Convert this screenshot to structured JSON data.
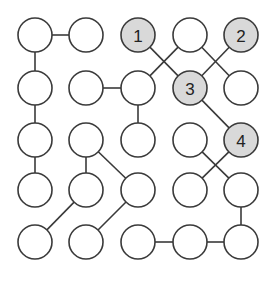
{
  "diagram": {
    "type": "numbered-circle-path-puzzle",
    "grid": {
      "rows": 5,
      "cols": 5
    },
    "colors": {
      "stroke": "#3a3a3a",
      "empty_fill": "#ffffff",
      "numbered_fill": "#d9d9d9",
      "label": "#222222"
    },
    "col_x": [
      35,
      86,
      138,
      190,
      241
    ],
    "row_y": [
      35,
      88,
      140,
      190,
      242
    ],
    "radius": 17,
    "nodes": [
      {
        "r": 0,
        "c": 0,
        "label": ""
      },
      {
        "r": 0,
        "c": 1,
        "label": ""
      },
      {
        "r": 0,
        "c": 2,
        "label": "1"
      },
      {
        "r": 0,
        "c": 3,
        "label": ""
      },
      {
        "r": 0,
        "c": 4,
        "label": "2"
      },
      {
        "r": 1,
        "c": 0,
        "label": ""
      },
      {
        "r": 1,
        "c": 1,
        "label": ""
      },
      {
        "r": 1,
        "c": 2,
        "label": ""
      },
      {
        "r": 1,
        "c": 3,
        "label": "3"
      },
      {
        "r": 1,
        "c": 4,
        "label": ""
      },
      {
        "r": 2,
        "c": 0,
        "label": ""
      },
      {
        "r": 2,
        "c": 1,
        "label": ""
      },
      {
        "r": 2,
        "c": 2,
        "label": ""
      },
      {
        "r": 2,
        "c": 3,
        "label": ""
      },
      {
        "r": 2,
        "c": 4,
        "label": "4"
      },
      {
        "r": 3,
        "c": 0,
        "label": ""
      },
      {
        "r": 3,
        "c": 1,
        "label": ""
      },
      {
        "r": 3,
        "c": 2,
        "label": ""
      },
      {
        "r": 3,
        "c": 3,
        "label": ""
      },
      {
        "r": 3,
        "c": 4,
        "label": ""
      },
      {
        "r": 4,
        "c": 0,
        "label": ""
      },
      {
        "r": 4,
        "c": 1,
        "label": ""
      },
      {
        "r": 4,
        "c": 2,
        "label": ""
      },
      {
        "r": 4,
        "c": 3,
        "label": ""
      },
      {
        "r": 4,
        "c": 4,
        "label": ""
      }
    ],
    "edges": [
      [
        [
          0,
          0
        ],
        [
          0,
          1
        ]
      ],
      [
        [
          0,
          0
        ],
        [
          1,
          0
        ]
      ],
      [
        [
          1,
          0
        ],
        [
          2,
          0
        ]
      ],
      [
        [
          2,
          0
        ],
        [
          3,
          0
        ]
      ],
      [
        [
          1,
          1
        ],
        [
          1,
          2
        ]
      ],
      [
        [
          1,
          2
        ],
        [
          2,
          2
        ]
      ],
      [
        [
          0,
          2
        ],
        [
          1,
          3
        ]
      ],
      [
        [
          0,
          3
        ],
        [
          1,
          2
        ]
      ],
      [
        [
          0,
          3
        ],
        [
          1,
          4
        ]
      ],
      [
        [
          0,
          4
        ],
        [
          1,
          3
        ]
      ],
      [
        [
          1,
          3
        ],
        [
          2,
          4
        ]
      ],
      [
        [
          2,
          1
        ],
        [
          3,
          1
        ]
      ],
      [
        [
          2,
          1
        ],
        [
          3,
          2
        ]
      ],
      [
        [
          3,
          1
        ],
        [
          4,
          0
        ]
      ],
      [
        [
          3,
          2
        ],
        [
          4,
          1
        ]
      ],
      [
        [
          2,
          3
        ],
        [
          3,
          4
        ]
      ],
      [
        [
          2,
          4
        ],
        [
          3,
          3
        ]
      ],
      [
        [
          3,
          4
        ],
        [
          4,
          4
        ]
      ],
      [
        [
          4,
          2
        ],
        [
          4,
          3
        ]
      ],
      [
        [
          4,
          3
        ],
        [
          4,
          4
        ]
      ]
    ]
  }
}
